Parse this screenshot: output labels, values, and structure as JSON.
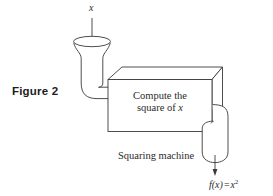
{
  "figure": {
    "caption": "Figure 2",
    "machine_label": "Squaring machine",
    "input_variable": "x",
    "box_line1": "Compute the",
    "box_line2_prefix": "square of ",
    "box_line2_var": "x",
    "output_function": "f(x)",
    "output_equals": "=",
    "output_base": "x",
    "output_exponent": "2",
    "ink_color": "#3a3a3a",
    "text_color": "#2b2b2b",
    "background_color": "#ffffff"
  },
  "parts": {
    "funnel": "input-funnel",
    "input_pipe": "input-pipe",
    "machine_box": "machine-box",
    "output_pipe": "output-pipe",
    "input_arrow": "input-arrow",
    "output_arrow": "output-arrow"
  }
}
